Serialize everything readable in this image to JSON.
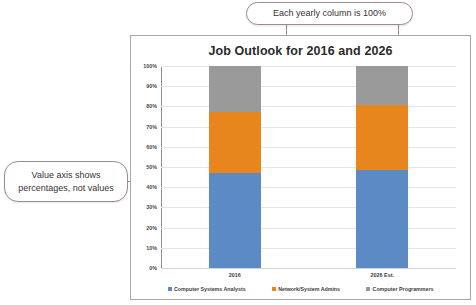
{
  "callouts": [
    {
      "name": "column-total-note",
      "text": "Each yearly column is 100%"
    },
    {
      "name": "value-axis-note",
      "text": "Value axis shows percentages, not values"
    }
  ],
  "chart_data": {
    "type": "bar",
    "subtype": "100% stacked column",
    "title": "Job Outlook for 2016 and 2026",
    "xlabel": "",
    "ylabel": "",
    "ylim": [
      0,
      100
    ],
    "grid": true,
    "legend_position": "bottom",
    "categories": [
      "2016",
      "2026 Est."
    ],
    "ticks": [
      "0%",
      "10%",
      "20%",
      "30%",
      "40%",
      "50%",
      "60%",
      "70%",
      "80%",
      "90%",
      "100%"
    ],
    "tick_values": [
      0,
      10,
      20,
      30,
      40,
      50,
      60,
      70,
      80,
      90,
      100
    ],
    "series": [
      {
        "name": "Computer Systems Analysts",
        "color": "#5b8ac4",
        "values": [
          47,
          48.5
        ]
      },
      {
        "name": "Network/System Admins",
        "color": "#e8861e",
        "values": [
          30,
          32
        ]
      },
      {
        "name": "Computer Programmers",
        "color": "#9a9a9a",
        "values": [
          23,
          19.5
        ]
      }
    ]
  }
}
